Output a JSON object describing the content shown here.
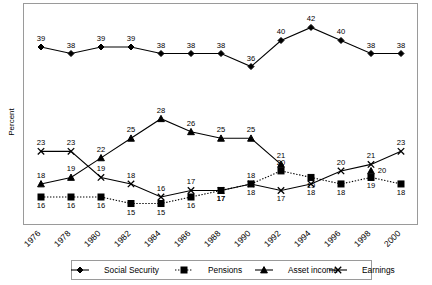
{
  "chart_data": {
    "type": "line",
    "title": "",
    "xlabel": "",
    "ylabel": "Percent",
    "grid": false,
    "legend_position": "bottom",
    "ylim": [
      0,
      46
    ],
    "categories": [
      "1976",
      "1978",
      "1980",
      "1982",
      "1984",
      "1986",
      "1988",
      "1990",
      "1992",
      "1994",
      "1996",
      "1998",
      "2000"
    ],
    "series": [
      {
        "name": "Social Security",
        "marker": "diamond",
        "linestyle": "solid",
        "values": [
          39,
          38,
          39,
          39,
          38,
          38,
          38,
          36,
          40,
          42,
          40,
          38,
          38
        ],
        "label_position": [
          "above",
          "above",
          "above",
          "above",
          "above",
          "above",
          "above",
          "above",
          "above",
          "above",
          "above",
          "above",
          "above"
        ]
      },
      {
        "name": "Pensions",
        "marker": "square",
        "linestyle": "dotted",
        "values": [
          16,
          16,
          16,
          15,
          15,
          16,
          17,
          18,
          20,
          19,
          18,
          19,
          18
        ],
        "label_position": [
          "below",
          "below",
          "below",
          "below",
          "below",
          "below",
          "below",
          "above",
          "above",
          "below",
          "below",
          "below",
          "below"
        ]
      },
      {
        "name": "Asset income",
        "marker": "triangle",
        "linestyle": "solid",
        "values": [
          18,
          19,
          22,
          25,
          28,
          26,
          25,
          25,
          21,
          null,
          null,
          20,
          null
        ],
        "label_position": [
          "above",
          "above",
          "above",
          "above",
          "above",
          "above",
          "above",
          "above",
          "above",
          null,
          null,
          "right",
          null
        ]
      },
      {
        "name": "Earnings",
        "marker": "x",
        "linestyle": "solid",
        "values": [
          23,
          23,
          19,
          18,
          16,
          17,
          17,
          18,
          17,
          18,
          20,
          21,
          23
        ],
        "label_position": [
          "above",
          "above",
          "above",
          "above",
          "above",
          "above",
          "below",
          "below",
          "below",
          "below",
          "above",
          "above",
          "above"
        ]
      }
    ]
  },
  "axis": {
    "ylabel": "Percent",
    "xticks": [
      "1976",
      "1978",
      "1980",
      "1982",
      "1984",
      "1986",
      "1988",
      "1990",
      "1992",
      "1994",
      "1996",
      "1998",
      "2000"
    ]
  },
  "legend": {
    "items": [
      {
        "label": "Social Security",
        "marker": "diamond",
        "linestyle": "solid"
      },
      {
        "label": "Pensions",
        "marker": "square",
        "linestyle": "dotted"
      },
      {
        "label": "Asset income",
        "marker": "triangle",
        "linestyle": "solid"
      },
      {
        "label": "Earnings",
        "marker": "x",
        "linestyle": "solid"
      }
    ]
  }
}
